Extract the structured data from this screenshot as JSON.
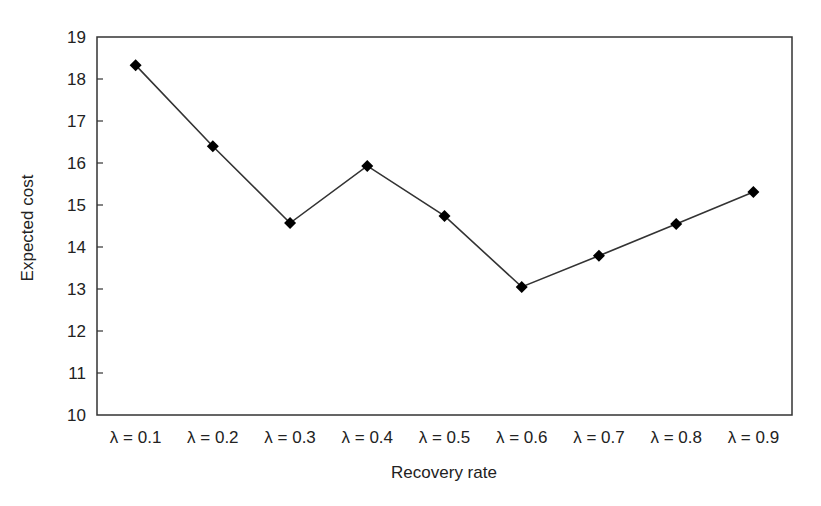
{
  "chart_data": {
    "type": "line",
    "title": "",
    "xlabel": "Recovery rate",
    "ylabel": "Expected cost",
    "categories": [
      "λ = 0.1",
      "λ = 0.2",
      "λ = 0.3",
      "λ = 0.4",
      "λ = 0.5",
      "λ = 0.6",
      "λ = 0.7",
      "λ = 0.8",
      "λ = 0.9"
    ],
    "series": [
      {
        "name": "Expected cost",
        "marker": "diamond",
        "color": "#000000",
        "values": [
          18.33,
          16.4,
          14.57,
          15.93,
          14.74,
          13.05,
          13.79,
          14.55,
          15.31
        ]
      }
    ],
    "ylim": [
      10,
      19
    ],
    "yticks": [
      10,
      11,
      12,
      13,
      14,
      15,
      16,
      17,
      18,
      19
    ],
    "grid": false,
    "legend": null
  },
  "colors": {
    "line": "#333333",
    "marker": "#000000",
    "axis": "#333333",
    "text": "#222222"
  }
}
